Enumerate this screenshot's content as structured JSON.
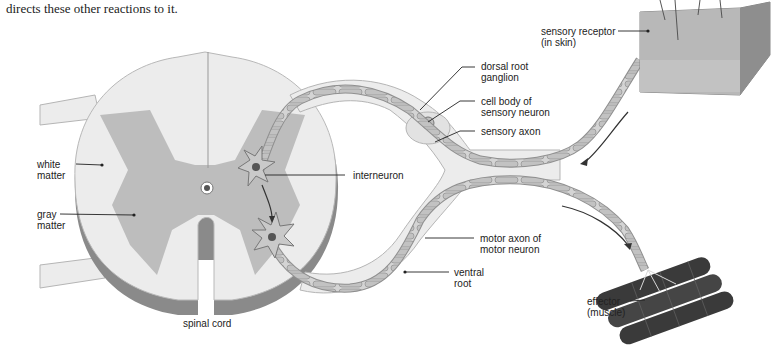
{
  "caption": "directs these other reactions to it.",
  "labels": {
    "white_matter": [
      "white",
      "matter"
    ],
    "gray_matter": [
      "gray",
      "matter"
    ],
    "interneuron": "interneuron",
    "dorsal_root_ganglion": [
      "dorsal root",
      "ganglion"
    ],
    "cell_body": [
      "cell body of",
      "sensory neuron"
    ],
    "sensory_axon": "sensory axon",
    "sensory_receptor": [
      "sensory receptor",
      "(in skin)"
    ],
    "motor_axon": [
      "motor axon of",
      "motor neuron"
    ],
    "ventral_root": [
      "ventral",
      "root"
    ],
    "effector": [
      "effector",
      "(muscle)"
    ],
    "spinal_cord": "spinal cord"
  },
  "colors": {
    "white_matter": "#ececec",
    "gray_matter": "#bdbdbd",
    "shadow": "#8a8a8a",
    "muscle": "#3a3a3a",
    "skin": "#a9a9a9"
  }
}
